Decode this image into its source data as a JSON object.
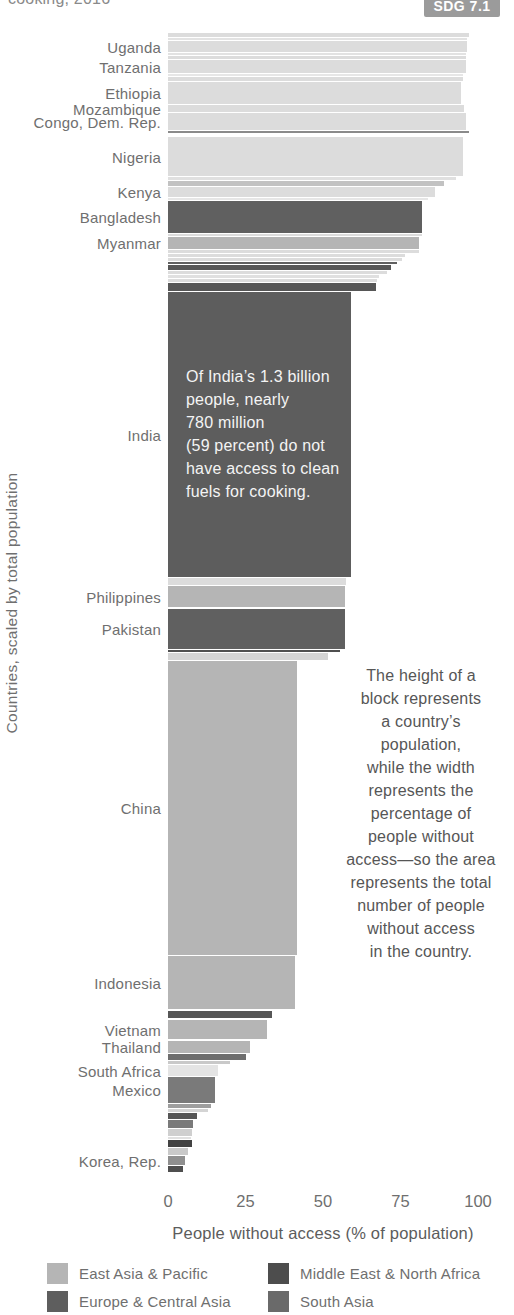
{
  "page": {
    "title_fragment": "cooking, 2016",
    "badge": "SDG 7.1"
  },
  "chart_data": {
    "type": "mekko",
    "xlabel": "People without access (% of population)",
    "ylabel": "Countries, scaled by total population",
    "xlim": [
      0,
      100
    ],
    "x_ticks": [
      0,
      25,
      50,
      75,
      100
    ],
    "px_per_percent": 3.1,
    "bars": [
      {
        "label": "",
        "pct": 97,
        "top": 33,
        "h": 4,
        "color": "#dcdcdc"
      },
      {
        "label": "",
        "pct": 96.5,
        "top": 38,
        "h": 2,
        "color": "#e2e2e2"
      },
      {
        "label": "Uganda",
        "pct": 96.5,
        "top": 41,
        "h": 11,
        "color": "#dcdcdc"
      },
      {
        "label": "",
        "pct": 96,
        "top": 53,
        "h": 2,
        "color": "#e2e2e2"
      },
      {
        "label": "",
        "pct": 96,
        "top": 56,
        "h": 3,
        "color": "#dcdcdc"
      },
      {
        "label": "Tanzania",
        "pct": 96,
        "top": 60,
        "h": 13,
        "color": "#dcdcdc"
      },
      {
        "label": "",
        "pct": 95,
        "top": 74,
        "h": 2,
        "color": "#e6e6e6"
      },
      {
        "label": "",
        "pct": 95,
        "top": 77,
        "h": 4,
        "color": "#dcdcdc"
      },
      {
        "label": "Ethiopia",
        "pct": 94.5,
        "top": 82,
        "h": 22,
        "color": "#dcdcdc"
      },
      {
        "label": "Mozambique",
        "pct": 95.5,
        "top": 105,
        "h": 7,
        "color": "#dcdcdc"
      },
      {
        "label": "Congo, Dem. Rep.",
        "pct": 96,
        "top": 113,
        "h": 17,
        "color": "#dcdcdc"
      },
      {
        "label": "",
        "pct": 97,
        "top": 131,
        "h": 2,
        "color": "#8a8a8a"
      },
      {
        "label": "Nigeria",
        "pct": 95,
        "top": 137,
        "h": 39,
        "color": "#dcdcdc"
      },
      {
        "label": "",
        "pct": 93,
        "top": 177,
        "h": 3,
        "color": "#e0e0e0"
      },
      {
        "label": "",
        "pct": 89,
        "top": 181,
        "h": 5,
        "color": "#c2c2c2"
      },
      {
        "label": "Kenya",
        "pct": 86,
        "top": 187,
        "h": 10,
        "color": "#dcdcdc"
      },
      {
        "label": "",
        "pct": 84,
        "top": 198,
        "h": 2,
        "color": "#e6e6e6"
      },
      {
        "label": "Bangladesh",
        "pct": 82,
        "top": 201,
        "h": 32,
        "color": "#606060"
      },
      {
        "label": "",
        "pct": 82,
        "top": 234,
        "h": 2,
        "color": "#dcdcdc"
      },
      {
        "label": "Myanmar",
        "pct": 81,
        "top": 237,
        "h": 12,
        "color": "#b5b5b5"
      },
      {
        "label": "",
        "pct": 81,
        "top": 250,
        "h": 3,
        "color": "#dcdcdc"
      },
      {
        "label": "",
        "pct": 76.5,
        "top": 254,
        "h": 3,
        "color": "#dcdcdc"
      },
      {
        "label": "",
        "pct": 75.5,
        "top": 258,
        "h": 3,
        "color": "#dcdcdc"
      },
      {
        "label": "",
        "pct": 74,
        "top": 262,
        "h": 2,
        "color": "#606060"
      },
      {
        "label": "",
        "pct": 72,
        "top": 265,
        "h": 5,
        "color": "#565656"
      },
      {
        "label": "",
        "pct": 70.5,
        "top": 271,
        "h": 3,
        "color": "#dcdcdc"
      },
      {
        "label": "",
        "pct": 68,
        "top": 275,
        "h": 3,
        "color": "#e0e0e0"
      },
      {
        "label": "",
        "pct": 67.5,
        "top": 279,
        "h": 3,
        "color": "#dcdcdc"
      },
      {
        "label": "",
        "pct": 67,
        "top": 283,
        "h": 8,
        "color": "#565656"
      },
      {
        "label": "India",
        "pct": 59,
        "top": 292,
        "h": 285,
        "color": "#5d5d5d"
      },
      {
        "label": "",
        "pct": 57.5,
        "top": 578,
        "h": 7,
        "color": "#dcdcdc"
      },
      {
        "label": "Philippines",
        "pct": 57,
        "top": 586,
        "h": 21,
        "color": "#b5b5b5"
      },
      {
        "label": "Pakistan",
        "pct": 57,
        "top": 609,
        "h": 40,
        "color": "#606060"
      },
      {
        "label": "",
        "pct": 55.5,
        "top": 650,
        "h": 2,
        "color": "#4f4f4f"
      },
      {
        "label": "",
        "pct": 51.5,
        "top": 653,
        "h": 7,
        "color": "#d4d4d4"
      },
      {
        "label": "China",
        "pct": 41.5,
        "top": 661,
        "h": 294,
        "color": "#b5b5b5"
      },
      {
        "label": "Indonesia",
        "pct": 41,
        "top": 956,
        "h": 53,
        "color": "#b5b5b5"
      },
      {
        "label": "",
        "pct": 33.5,
        "top": 1011,
        "h": 7,
        "color": "#565656"
      },
      {
        "label": "Vietnam",
        "pct": 32,
        "top": 1020,
        "h": 19,
        "color": "#b5b5b5"
      },
      {
        "label": "Thailand",
        "pct": 26.5,
        "top": 1041,
        "h": 12,
        "color": "#b5b5b5"
      },
      {
        "label": "",
        "pct": 25,
        "top": 1054,
        "h": 6,
        "color": "#6e6e6e"
      },
      {
        "label": "",
        "pct": 20,
        "top": 1061,
        "h": 3,
        "color": "#c9c9c9"
      },
      {
        "label": "South Africa",
        "pct": 16,
        "top": 1065,
        "h": 11,
        "color": "#e4e4e4"
      },
      {
        "label": "Mexico",
        "pct": 15,
        "top": 1077,
        "h": 26,
        "color": "#7a7a7a"
      },
      {
        "label": "",
        "pct": 14,
        "top": 1104,
        "h": 4,
        "color": "#9e9e9e"
      },
      {
        "label": "",
        "pct": 13,
        "top": 1109,
        "h": 3,
        "color": "#d4d4d4"
      },
      {
        "label": "",
        "pct": 9.5,
        "top": 1113,
        "h": 6,
        "color": "#565656"
      },
      {
        "label": "",
        "pct": 8,
        "top": 1120,
        "h": 8,
        "color": "#7a7a7a"
      },
      {
        "label": "",
        "pct": 7.7,
        "top": 1129,
        "h": 7,
        "color": "#cfcfcf"
      },
      {
        "label": "",
        "pct": 7.5,
        "top": 1137,
        "h": 2,
        "color": "#e0e0e0"
      },
      {
        "label": "",
        "pct": 7.6,
        "top": 1140,
        "h": 7,
        "color": "#424242"
      },
      {
        "label": "",
        "pct": 6.3,
        "top": 1148,
        "h": 7,
        "color": "#c9c9c9"
      },
      {
        "label": "Korea, Rep.",
        "pct": 5.4,
        "top": 1156,
        "h": 9,
        "color": "#8f8f8f"
      },
      {
        "label": "",
        "pct": 4.7,
        "top": 1166,
        "h": 6,
        "color": "#4f4f4f"
      }
    ],
    "annotations": {
      "india": "Of India’s 1.3 billion\npeople, nearly\n780 million\n(59 percent) do not\nhave access to clean\nfuels for cooking.",
      "explainer": "The height of a\nblock represents\na country’s\npopulation,\nwhile the width\nrepresents the\npercentage of\npeople without\naccess—so the area\nrepresents the total\nnumber of people\nwithout access\nin the country."
    },
    "legend": [
      {
        "label": "East Asia & Pacific",
        "color": "#b5b5b5"
      },
      {
        "label": "Europe & Central Asia",
        "color": "#5e5e5e"
      },
      {
        "label": "Middle East & North Africa",
        "color": "#4d4d4d"
      },
      {
        "label": "South Asia",
        "color": "#6a6a6a"
      }
    ]
  }
}
